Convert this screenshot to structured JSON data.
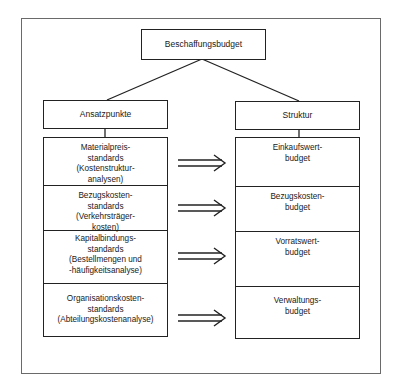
{
  "diagram": {
    "root": {
      "label": "Beschaffungsbudget"
    },
    "left": {
      "header": "Ansatzpunkte",
      "items": [
        "Materialpreis-\nstandards\n(Kostenstruktur-\nanalysen)",
        "Bezugskosten-\nstandards\n(Verkehrsträger-\nkosten)",
        "Kapitalbindungs-\nstandards\n(Bestellmengen und\n-häufigkeitsanalyse)",
        "Organisationskosten-\nstandards\n(Abteilungskostenanalyse)"
      ]
    },
    "right": {
      "header": "Struktur",
      "items": [
        "Einkaufswert-\nbudget",
        "Bezugskosten-\nbudget",
        "Vorratswert-\nbudget",
        "Verwaltungs-\nbudget"
      ]
    },
    "arrow_glyph": "double-right-arrow",
    "colors": {
      "line": "#222222",
      "frame": "#6a6a6a",
      "background": "#ffffff"
    }
  }
}
